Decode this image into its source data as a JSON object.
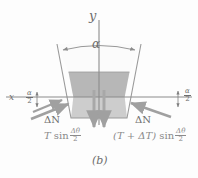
{
  "figure": {
    "caption": "(b)",
    "axes": {
      "y_label": "y",
      "x_label": "x"
    },
    "angles": {
      "apex_label": "α",
      "half_numerator": "α",
      "half_denominator": "2"
    },
    "forces": {
      "normal_left_label": "ΔN",
      "normal_right_label": "ΔN",
      "tension_left": {
        "factor": "T",
        "function": "sin",
        "arg_numerator": "Δθ",
        "arg_denominator": "2"
      },
      "tension_right": {
        "factor": "(T + ΔT)",
        "function": "sin",
        "arg_numerator": "Δθ",
        "arg_denominator": "2"
      }
    },
    "colors": {
      "axis": "#8c8c8c",
      "outline": "#9a9a9a",
      "fill_upper": "#b9b9b9",
      "fill_lower": "#cfcfcf",
      "fill_top": "#fbfbfb",
      "arrow": "#a0a0a0",
      "text": "#6d6d6d",
      "formula_text": "#8a8a8a"
    },
    "geometry": {
      "apex_angle_degrees": 26,
      "trapezoid_top_left_x": 57,
      "trapezoid_top_right_x": 141,
      "trapezoid_bottom_left_x": 71,
      "trapezoid_bottom_right_x": 127,
      "trapezoid_top_y": 44,
      "trapezoid_bottom_y": 118,
      "upper_fill_start_y": 72,
      "x_axis_y": 97
    }
  }
}
